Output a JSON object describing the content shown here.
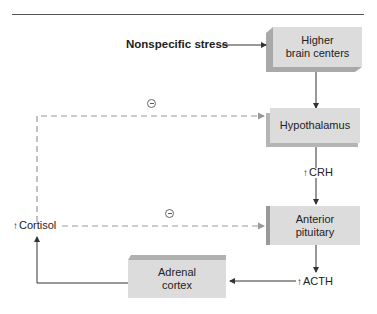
{
  "diagram": {
    "input": "Nonspecific stress",
    "nodes": [
      {
        "id": "higher",
        "label_line1": "Higher",
        "label_line2": "brain centers"
      },
      {
        "id": "hypothalamus",
        "label_line1": "Hypothalamus"
      },
      {
        "id": "anterior",
        "label_line1": "Anterior",
        "label_line2": "pituitary"
      },
      {
        "id": "adrenal",
        "label_line1": "Adrenal",
        "label_line2": "cortex"
      }
    ],
    "hormones": {
      "crh": "CRH",
      "acth": "ACTH",
      "cortisol": "Cortisol",
      "increase_symbol": "↑"
    },
    "feedback": {
      "symbol": "−",
      "targets": [
        "Hypothalamus",
        "Anterior pituitary"
      ],
      "type": "negative"
    },
    "colors": {
      "box": "#dcdcdc",
      "box_shadow": "#a8a8a8",
      "solid_line": "#444444",
      "dashed_line": "#9a9a9a"
    }
  }
}
